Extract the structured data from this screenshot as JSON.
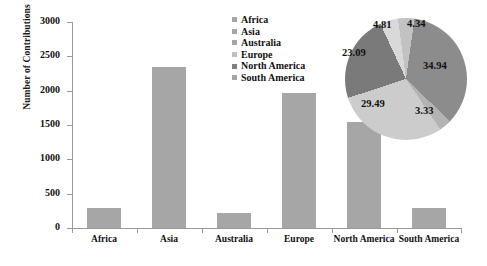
{
  "chart_data": [
    {
      "type": "bar",
      "title": "",
      "xlabel": "",
      "ylabel": "Number of Contributions",
      "categories": [
        "Africa",
        "Asia",
        "Australia",
        "Europe",
        "North America",
        "South America"
      ],
      "values": [
        290,
        2338,
        223,
        1973,
        1545,
        290
      ],
      "ylim": [
        0,
        3000
      ],
      "yticks": [
        0,
        500,
        1000,
        1500,
        2000,
        2500,
        3000
      ],
      "ytick_labels": [
        "0",
        "500",
        "1000",
        "1500",
        "2000",
        "2500",
        "3000"
      ],
      "grid": false,
      "bar_color": "#a6a6a6",
      "legend": {
        "position": "top-right",
        "entries": [
          {
            "label": "Africa",
            "color": "#a6a6a6"
          },
          {
            "label": "Asia",
            "color": "#a6a6a6"
          },
          {
            "label": "Australia",
            "color": "#a6a6a6"
          },
          {
            "label": "Europe",
            "color": "#bfbfbf"
          },
          {
            "label": "North America",
            "color": "#808080"
          },
          {
            "label": "South America",
            "color": "#a6a6a6"
          }
        ]
      }
    },
    {
      "type": "pie",
      "title": "",
      "labels": [
        "Asia",
        "South America",
        "Europe",
        "North America",
        "Africa",
        "Australia"
      ],
      "values": [
        34.94,
        3.33,
        29.49,
        23.09,
        4.81,
        4.34
      ],
      "data_labels": [
        "34.94",
        "3.33",
        "29.49",
        "23.09",
        "4.81",
        "4.34"
      ],
      "slice_colors": [
        "#8c8c8c",
        "#b3b3b3",
        "#cccccc",
        "#7a7a7a",
        "#d9d9d9",
        "#c2c2c2"
      ],
      "legend_position": "left"
    }
  ],
  "axis": {
    "y_title": "Number of Contributions"
  },
  "pie_labels": {
    "asia": "34.94",
    "south_america": "3.33",
    "europe": "29.49",
    "north_america": "23.09",
    "africa": "4.81",
    "australia": "4.34"
  }
}
